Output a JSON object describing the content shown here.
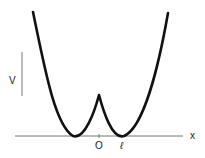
{
  "diagram": {
    "labels": {
      "y_axis": "V",
      "x_axis": "x",
      "origin": "O",
      "well": "ℓ"
    },
    "colors": {
      "curve": "#111111",
      "axis": "#666666",
      "background": "#ffffff"
    }
  }
}
